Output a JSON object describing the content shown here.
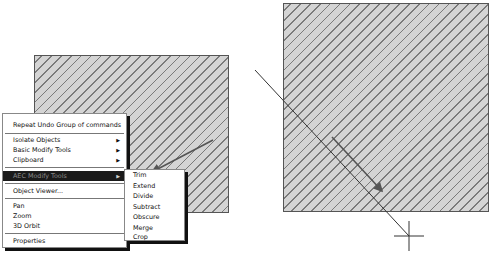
{
  "canvas": {
    "left_object": "hatched-square",
    "right_object": "hatched-square"
  },
  "context_menu": {
    "items": [
      {
        "label": "Repeat Undo Group of commands",
        "submenu": false
      },
      {
        "label": "Isolate Objects",
        "submenu": true
      },
      {
        "label": "Basic Modify Tools",
        "submenu": true
      },
      {
        "label": "Clipboard",
        "submenu": true
      },
      {
        "label": "AEC Modify Tools",
        "submenu": true,
        "active": true
      },
      {
        "label": "Object Viewer...",
        "submenu": false
      },
      {
        "label": "Pan",
        "submenu": false
      },
      {
        "label": "Zoom",
        "submenu": false
      },
      {
        "label": "3D Orbit",
        "submenu": false
      },
      {
        "label": "Properties",
        "submenu": false
      }
    ],
    "submenu_arrow": "▶"
  },
  "submenu": {
    "parent": "AEC Modify Tools",
    "items": [
      {
        "label": "Trim"
      },
      {
        "label": "Extend"
      },
      {
        "label": "Divide"
      },
      {
        "label": "Subtract"
      },
      {
        "label": "Obscure"
      },
      {
        "label": "Merge"
      },
      {
        "label": "Crop"
      }
    ]
  },
  "colors": {
    "menu_highlight_bg": "#1a1a1a",
    "menu_highlight_text": "#8a8a8a",
    "hatch_fill": "#d4d4d4",
    "hatch_line": "#7a7a7a",
    "annotation_arrow": "#555555"
  }
}
